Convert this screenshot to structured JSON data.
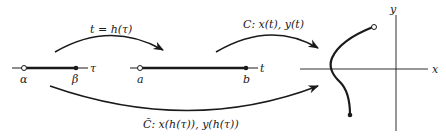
{
  "diagram": {
    "interval_tau": {
      "start_label": "α",
      "end_label": "β",
      "axis_label": "τ"
    },
    "interval_t": {
      "start_label": "a",
      "end_label": "b",
      "axis_label": "t"
    },
    "plane": {
      "x_label": "x",
      "y_label": "y"
    },
    "arrows": {
      "reparam_label": "t = h(τ)",
      "curve_label": "C:  x(t), y(t)",
      "composite_label": "C̃:  x(h(τ)), y(h(τ))"
    },
    "colors": {
      "ink": "#1a1a1a",
      "background": "#ffffff"
    }
  }
}
